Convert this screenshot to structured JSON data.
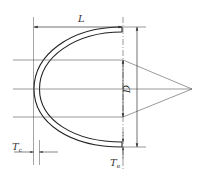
{
  "diagram": {
    "colors": {
      "line": "#333333",
      "thin_line": "#555555",
      "background": "#ffffff"
    },
    "labels": {
      "length": "L",
      "diameter": "D",
      "thickness_crown_base": "T",
      "thickness_crown_sub": "c",
      "thickness_end_base": "T",
      "thickness_end_sub": "e"
    },
    "dimensions": [
      {
        "name": "L",
        "meaning": "overall length of cap",
        "orientation": "horizontal"
      },
      {
        "name": "D",
        "meaning": "outside diameter",
        "orientation": "vertical"
      },
      {
        "name": "Tc",
        "meaning": "wall thickness at crown",
        "orientation": "horizontal"
      },
      {
        "name": "Te",
        "meaning": "wall thickness at end",
        "orientation": "vertical"
      }
    ]
  }
}
